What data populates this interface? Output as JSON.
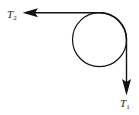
{
  "diagram": {
    "type": "pulley-tension",
    "pulley": {
      "cx": 99.5,
      "cy": 39.7,
      "r": 27
    },
    "labels": {
      "t2_main": "T",
      "t2_sub": "2",
      "t1_main": "T",
      "t1_sub": "1"
    },
    "colors": {
      "stroke": "#111111",
      "text": "#222222",
      "background": "#ffffff"
    }
  }
}
